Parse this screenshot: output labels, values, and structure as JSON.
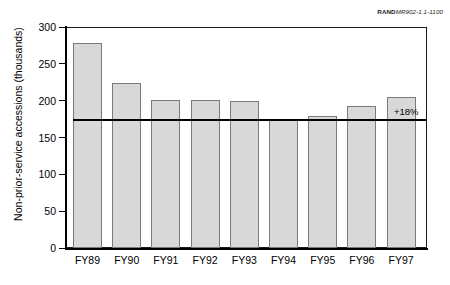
{
  "source_id": {
    "brand": "RAND",
    "document_number": "MR902-1.1-1100"
  },
  "chart_data": {
    "type": "bar",
    "title": "",
    "subtitle": "",
    "xlabel": "",
    "ylabel": "Non-prior-service accessions (thousands)",
    "categories": [
      "FY89",
      "FY90",
      "FY91",
      "FY92",
      "FY93",
      "FY94",
      "FY95",
      "FY96",
      "FY97"
    ],
    "values": [
      278,
      224,
      201,
      201,
      199,
      174,
      179,
      193,
      205
    ],
    "ylim": [
      0,
      300
    ],
    "yticks": [
      0,
      50,
      100,
      150,
      200,
      250,
      300
    ],
    "ytick_labels": [
      "0",
      "50",
      "100",
      "150",
      "200",
      "250",
      "300"
    ],
    "grid": false,
    "legend": null,
    "bar_fill_color": "#d8d8d8",
    "bar_edge_color": "#7a7a7a",
    "axis_color": "#000000",
    "annotations": [
      {
        "name": "reference-line-annotation",
        "label": "+18%",
        "reference_value": 174,
        "description": "horizontal reference line at the FY94 level extending to the right edge of the plot"
      }
    ]
  }
}
